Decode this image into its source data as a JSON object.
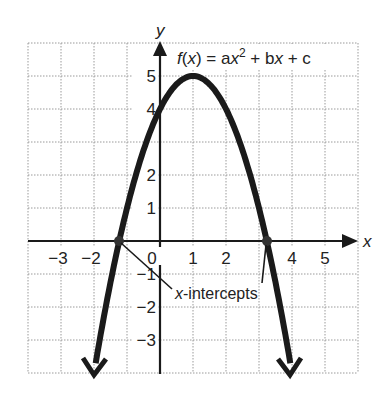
{
  "chart_data": {
    "type": "line",
    "title_parts": {
      "f": "f",
      "open": "(",
      "x": "x",
      "eq": ") = a",
      "x2": "x",
      "sup": "2",
      "plus_b": " + b",
      "x3": "x",
      "plus_c": " + c"
    },
    "xlabel": "x",
    "ylabel": "y",
    "xlim": [
      -4,
      6
    ],
    "ylim": [
      -4,
      6
    ],
    "grid": true,
    "x_ticks": [
      {
        "value": -3,
        "label": "−3"
      },
      {
        "value": -2,
        "label": "−2"
      },
      {
        "value": 0,
        "label": "0"
      },
      {
        "value": 1,
        "label": "1"
      },
      {
        "value": 2,
        "label": "2"
      },
      {
        "value": 4,
        "label": "4"
      },
      {
        "value": 5,
        "label": "5"
      }
    ],
    "y_ticks": [
      {
        "value": 5,
        "label": "5"
      },
      {
        "value": 4,
        "label": "4"
      },
      {
        "value": 2,
        "label": "2"
      },
      {
        "value": 1,
        "label": "1"
      },
      {
        "value": -1,
        "label": "−1"
      },
      {
        "value": -2,
        "label": "−2"
      },
      {
        "value": -3,
        "label": "−3"
      }
    ],
    "series": [
      {
        "name": "f(x)",
        "function": "-x^2 + 2x + 4",
        "x": [
          -2,
          -1.5,
          -1.236,
          -1,
          -0.5,
          0,
          0.5,
          1,
          1.5,
          2,
          2.5,
          3,
          3.236,
          3.5,
          4
        ],
        "y": [
          -4,
          -1.25,
          0,
          1,
          2.75,
          4,
          4.75,
          5,
          4.75,
          4,
          2.75,
          1,
          0,
          -1.25,
          -4
        ],
        "vertex": [
          1,
          5
        ],
        "y_intercept": 4,
        "arrows_at_ends": true
      }
    ],
    "annotations": [
      {
        "text": "x-intercepts",
        "text_italic_part": "x",
        "text_rest": "-intercepts",
        "points": [
          [
            -1.236,
            0
          ],
          [
            3.236,
            0
          ]
        ]
      }
    ]
  }
}
